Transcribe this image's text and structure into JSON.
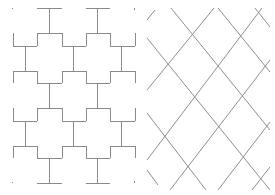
{
  "figure": {
    "left_panel": {
      "description": "Orthogonal stepped tree / H-fractal-like tiling pattern",
      "line_color": "#8a8a8a"
    },
    "right_panel": {
      "description": "Diagonal lattice of crossing lines (diamond grid)",
      "line_color": "#8f8f8f"
    },
    "caption": ""
  }
}
